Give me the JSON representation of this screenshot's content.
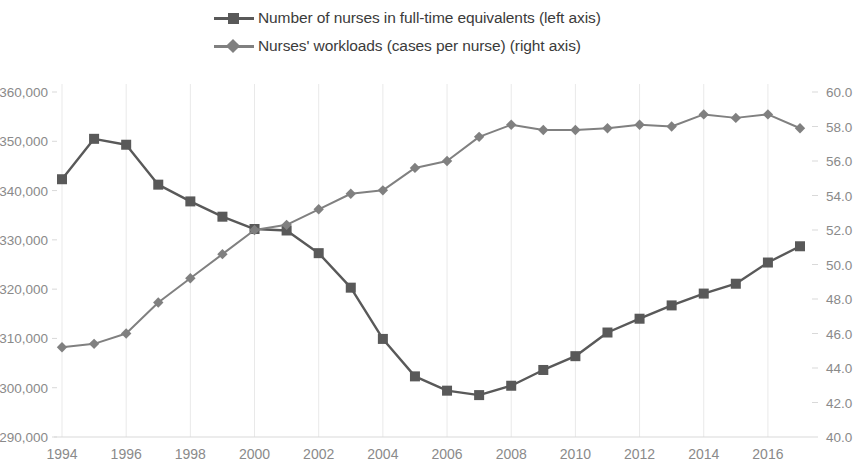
{
  "legend": {
    "items": [
      {
        "label": "Number of nurses in full-time equivalents (left axis)",
        "marker": "square-marker-icon",
        "color": "#595959"
      },
      {
        "label": "Nurses' workloads (cases per nurse) (right axis)",
        "marker": "diamond-marker-icon",
        "color": "#808080"
      }
    ]
  },
  "chart_data": {
    "type": "line",
    "title": "",
    "xlabel": "",
    "ylabel": "",
    "grid": false,
    "legend_position": "top",
    "x": [
      1994,
      1995,
      1996,
      1997,
      1998,
      1999,
      2000,
      2001,
      2002,
      2003,
      2004,
      2005,
      2006,
      2007,
      2008,
      2009,
      2010,
      2011,
      2012,
      2013,
      2014,
      2015,
      2016,
      2017
    ],
    "xtick_labels": [
      "1994",
      "1996",
      "1998",
      "2000",
      "2002",
      "2004",
      "2006",
      "2008",
      "2010",
      "2012",
      "2014",
      "2016"
    ],
    "left_axis": {
      "ylim": [
        290000,
        360000
      ],
      "tick_labels": [
        "290,000",
        "300,000",
        "310,000",
        "320,000",
        "330,000",
        "340,000",
        "350,000",
        "360,000"
      ],
      "ticks": [
        290000,
        300000,
        310000,
        320000,
        330000,
        340000,
        350000,
        360000
      ]
    },
    "right_axis": {
      "ylim": [
        40.0,
        60.0
      ],
      "tick_labels": [
        "40.0",
        "42.0",
        "44.0",
        "46.0",
        "48.0",
        "50.0",
        "52.0",
        "54.0",
        "56.0",
        "58.0",
        "60.0"
      ],
      "ticks": [
        40,
        42,
        44,
        46,
        48,
        50,
        52,
        54,
        56,
        58,
        60
      ]
    },
    "series": [
      {
        "name": "Number of nurses in full-time equivalents (left axis)",
        "axis": "left",
        "color": "#595959",
        "marker": "square",
        "values": [
          342300,
          350500,
          349300,
          341200,
          337800,
          334700,
          332200,
          331900,
          327300,
          320300,
          309900,
          302300,
          299400,
          298500,
          300400,
          303600,
          306400,
          311200,
          314000,
          316700,
          319100,
          321100,
          325400,
          328700
        ]
      },
      {
        "name": "Nurses' workloads (cases per nurse) (right axis)",
        "axis": "right",
        "color": "#808080",
        "marker": "diamond",
        "values": [
          45.2,
          45.4,
          46.0,
          47.8,
          49.2,
          50.6,
          52.0,
          52.3,
          53.2,
          54.1,
          54.3,
          55.6,
          56.0,
          57.4,
          58.1,
          57.8,
          57.8,
          57.9,
          58.1,
          58.0,
          58.7,
          58.5,
          58.7,
          57.9
        ]
      }
    ]
  }
}
